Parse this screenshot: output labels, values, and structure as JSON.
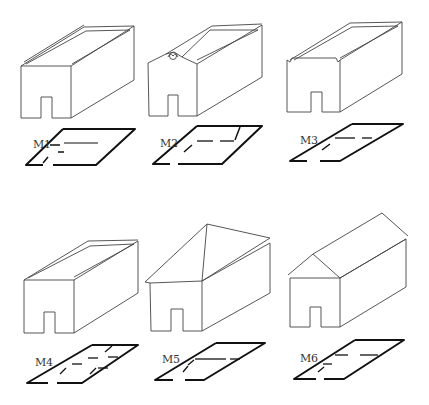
{
  "figure": {
    "models": [
      {
        "id": "M1",
        "label": "M1",
        "roof": "flat-parapet"
      },
      {
        "id": "M2",
        "label": "M2",
        "roof": "flat-ornamented-gable-front"
      },
      {
        "id": "M3",
        "label": "M3",
        "roof": "flat-notched-parapet"
      },
      {
        "id": "M4",
        "label": "M4",
        "roof": "flat-parapet"
      },
      {
        "id": "M5",
        "label": "M5",
        "roof": "hipped"
      },
      {
        "id": "M6",
        "label": "M6",
        "roof": "gabled"
      }
    ]
  },
  "colors": {
    "line": "#333333",
    "plan": "#111111",
    "background": "#ffffff"
  }
}
